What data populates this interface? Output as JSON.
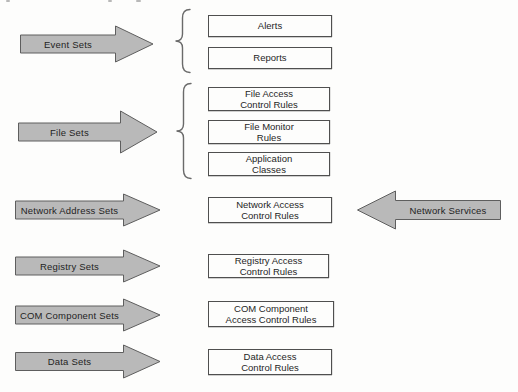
{
  "colors": {
    "background": "#fdfdfc",
    "arrow_fill": "#b9b9b9",
    "arrow_stroke": "#5e5e5e",
    "box_fill": "#fdfdfc",
    "box_stroke": "#4f4f4f",
    "brace_stroke": "#6a6a6a",
    "text": "#1f1f1f"
  },
  "diagram": {
    "groups": [
      {
        "set_label": "Event Sets",
        "targets": [
          "Alerts",
          "Reports"
        ]
      },
      {
        "set_label": "File Sets",
        "targets": [
          "File Access\nControl Rules",
          "File Monitor\nRules",
          "Application\nClasses"
        ]
      },
      {
        "set_label": "Network Address Sets",
        "targets": [
          "Network Access\nControl Rules"
        ],
        "incoming_label": "Network Services"
      },
      {
        "set_label": "Registry Sets",
        "targets": [
          "Registry Access\nControl Rules"
        ]
      },
      {
        "set_label": "COM Component Sets",
        "targets": [
          "COM Component\nAccess Control Rules"
        ]
      },
      {
        "set_label": "Data Sets",
        "targets": [
          "Data Access\nControl Rules"
        ]
      }
    ]
  }
}
